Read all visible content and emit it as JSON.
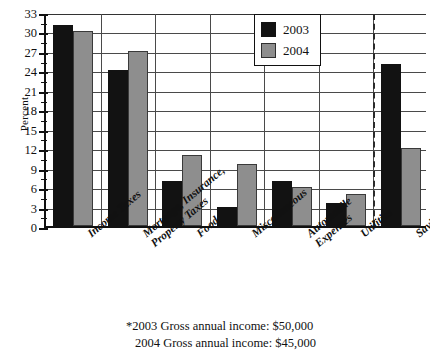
{
  "chart_data": {
    "type": "bar",
    "title": "",
    "xlabel": "",
    "ylabel": "Percent",
    "ylim": [
      0,
      33
    ],
    "ytick_step": 3,
    "yticks": [
      0,
      3,
      6,
      9,
      12,
      15,
      18,
      21,
      24,
      27,
      30,
      33
    ],
    "grid": true,
    "legend_position": "top-right",
    "categories": [
      "Income Taxes",
      "Mortgage, Insurance, Property Taxes",
      "Food",
      "Miscellaneous",
      "Automobile Expenses",
      "Utilities",
      "Savings"
    ],
    "series": [
      {
        "name": "2003",
        "color": "#121212",
        "values": [
          31,
          24,
          7,
          3,
          7,
          3.5,
          25
        ]
      },
      {
        "name": "2004",
        "color": "#8e8e8e",
        "values": [
          30,
          27,
          11,
          9.5,
          6,
          5,
          12
        ]
      }
    ],
    "annotations": [
      {
        "type": "vertical-dashed-line",
        "after_category": "Utilities"
      }
    ],
    "footnotes": [
      "*2003 Gross annual income:  $50,000",
      "2004 Gross annual income:  $45,000"
    ]
  },
  "axis": {
    "y_title": "Percent",
    "y_tick_labels": [
      "33",
      "30",
      "27",
      "24",
      "21",
      "18",
      "15",
      "12",
      "9",
      "6",
      "3",
      "0"
    ]
  },
  "legend": {
    "items": [
      {
        "label": "2003"
      },
      {
        "label": "2004"
      }
    ]
  },
  "x_categories": [
    {
      "line1": "Income Taxes",
      "line2": ""
    },
    {
      "line1": "Mortgage, Insurance,",
      "line2": "Property Taxes"
    },
    {
      "line1": "Food",
      "line2": ""
    },
    {
      "line1": "Miscellaneous",
      "line2": ""
    },
    {
      "line1": "Automobile",
      "line2": "Expenses"
    },
    {
      "line1": "Utilities",
      "line2": ""
    },
    {
      "line1": "Savings",
      "line2": ""
    }
  ],
  "footnotes": {
    "line1": "*2003 Gross annual income:  $50,000",
    "line2": "2004 Gross annual income:  $45,000"
  }
}
